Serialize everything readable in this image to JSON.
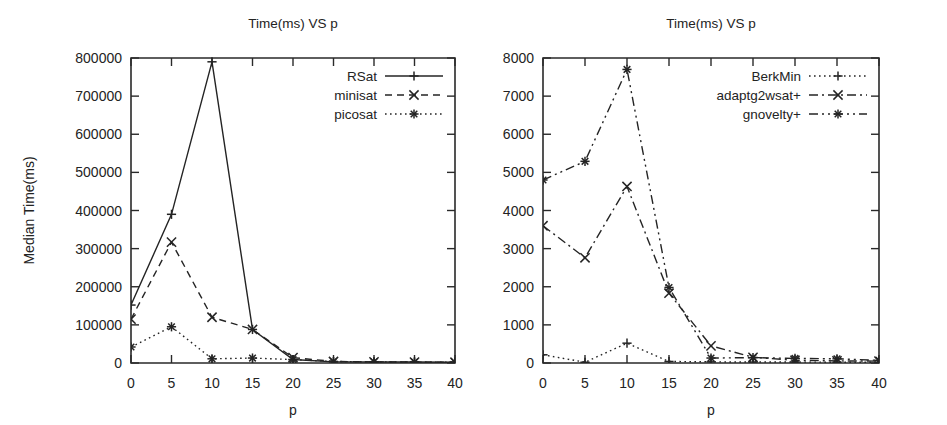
{
  "figure": {
    "width": 947,
    "height": 425,
    "background": "#ffffff",
    "ink_color": "#242424",
    "panel_count": 2
  },
  "chart_data": [
    {
      "id": "left-panel",
      "type": "line",
      "title": "Time(ms) VS p",
      "xlabel": "p",
      "ylabel": "Median Time(ms)",
      "x": [
        0,
        5,
        10,
        15,
        20,
        25,
        30,
        35,
        40
      ],
      "xtick_labels": [
        "0",
        "5",
        "10",
        "15",
        "20",
        "25",
        "30",
        "35",
        "40"
      ],
      "ytick_labels": [
        "0",
        "100000",
        "200000",
        "300000",
        "400000",
        "500000",
        "600000",
        "700000",
        "800000"
      ],
      "ytick_values": [
        0,
        100000,
        200000,
        300000,
        400000,
        500000,
        600000,
        700000,
        800000
      ],
      "xlim": [
        0,
        40
      ],
      "ylim": [
        0,
        800000
      ],
      "grid": false,
      "legend_position": "top-right",
      "series": [
        {
          "name": "RSat",
          "dash": "solid",
          "marker": "plus",
          "values": [
            152000,
            390000,
            790000,
            88000,
            9000,
            3000,
            2500,
            2500,
            2000
          ]
        },
        {
          "name": "minisat",
          "dash": "dashed",
          "marker": "cross",
          "values": [
            115000,
            317000,
            120000,
            88000,
            14000,
            4000,
            3000,
            2500,
            2000
          ]
        },
        {
          "name": "picosat",
          "dash": "dotted",
          "marker": "star",
          "values": [
            42000,
            95000,
            11000,
            13000,
            9000,
            4000,
            3000,
            2500,
            2000
          ]
        }
      ]
    },
    {
      "id": "right-panel",
      "type": "line",
      "title": "Time(ms) VS p",
      "xlabel": "p",
      "ylabel": "",
      "x": [
        0,
        5,
        10,
        15,
        20,
        25,
        30,
        35,
        40
      ],
      "xtick_labels": [
        "0",
        "5",
        "10",
        "15",
        "20",
        "25",
        "30",
        "35",
        "40"
      ],
      "ytick_labels": [
        "0",
        "1000",
        "2000",
        "3000",
        "4000",
        "5000",
        "6000",
        "7000",
        "8000"
      ],
      "ytick_values": [
        0,
        1000,
        2000,
        3000,
        4000,
        5000,
        6000,
        7000,
        8000
      ],
      "xlim": [
        0,
        40
      ],
      "ylim": [
        0,
        8000
      ],
      "grid": false,
      "legend_position": "top-right",
      "series": [
        {
          "name": "BerkMin",
          "dash": "dotted",
          "marker": "plus",
          "values": [
            215,
            20,
            520,
            40,
            30,
            25,
            25,
            20,
            20
          ]
        },
        {
          "name": "adaptg2wsat+",
          "dash": "dashdot",
          "marker": "cross",
          "values": [
            3600,
            2760,
            4630,
            1830,
            450,
            150,
            70,
            55,
            50
          ]
        },
        {
          "name": "gnovelty+",
          "dash": "dashdotdot",
          "marker": "star",
          "values": [
            4800,
            5290,
            7700,
            1980,
            130,
            140,
            120,
            110,
            70
          ]
        }
      ]
    }
  ]
}
